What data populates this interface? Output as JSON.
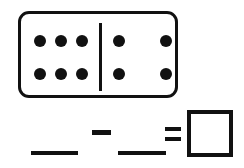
{
  "worksheet": {
    "type": "domino-subtraction",
    "accent_color": "#111111",
    "background_color": "#ffffff"
  },
  "domino": {
    "name": "domino-tile",
    "left_half": {
      "label": "left-half",
      "pip_count": 6,
      "rows": 2,
      "columns": 3,
      "pips": [
        {
          "row": 0,
          "col": 0
        },
        {
          "row": 0,
          "col": 1
        },
        {
          "row": 0,
          "col": 2
        },
        {
          "row": 1,
          "col": 0
        },
        {
          "row": 1,
          "col": 1
        },
        {
          "row": 1,
          "col": 2
        }
      ]
    },
    "right_half": {
      "label": "right-half",
      "pip_count": 4,
      "rows": 2,
      "columns": 2,
      "pips": [
        {
          "row": 0,
          "col": 0
        },
        {
          "row": 0,
          "col": 1
        },
        {
          "row": 1,
          "col": 0
        },
        {
          "row": 1,
          "col": 1
        }
      ]
    }
  },
  "equation": {
    "minuend_blank": "",
    "minuend_placeholder": "",
    "operator": "−",
    "subtrahend_blank": "",
    "subtrahend_placeholder": "",
    "equals": "=",
    "answer": "",
    "answer_placeholder": ""
  }
}
